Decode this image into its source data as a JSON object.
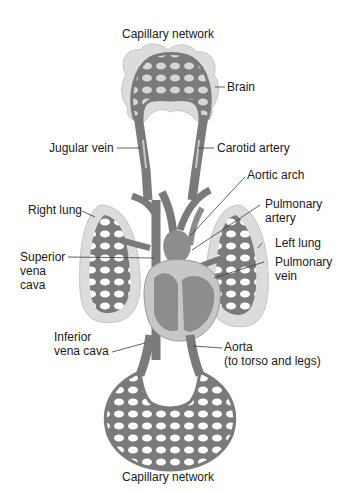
{
  "diagram": {
    "type": "circulatory-system",
    "colors": {
      "vessel": "#7a7a7a",
      "vessel_light": "#b0b0b0",
      "organ_fill": "#dcdcdc",
      "organ_edge": "#bdbdbd",
      "heart": "#8d8d8d",
      "label_text": "#1a1a1a"
    },
    "labels": {
      "capillary_top": "Capillary network",
      "brain": "Brain",
      "jugular_vein": "Jugular vein",
      "carotid_artery": "Carotid artery",
      "aortic_arch": "Aortic arch",
      "right_lung": "Right lung",
      "pulmonary_artery_1": "Pulmonary",
      "pulmonary_artery_2": "artery",
      "left_lung": "Left lung",
      "superior_vena_cava_1": "Superior",
      "superior_vena_cava_2": "vena",
      "superior_vena_cava_3": "cava",
      "pulmonary_vein_1": "Pulmonary",
      "pulmonary_vein_2": "vein",
      "inferior_vena_cava_1": "Inferior",
      "inferior_vena_cava_2": "vena cava",
      "aorta_1": "Aorta",
      "aorta_2": "(to torso and legs)",
      "capillary_bottom": "Capillary network"
    }
  }
}
